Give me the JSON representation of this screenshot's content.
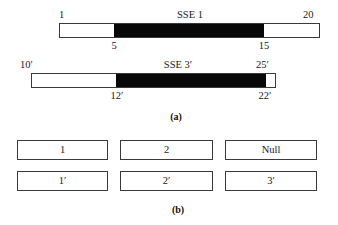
{
  "figure": {
    "part_a": {
      "caption": "(a)",
      "bars": [
        {
          "name": "sse-1",
          "title": "SSE 1",
          "start_label": "1",
          "end_label": "20",
          "region_start_label": "5",
          "region_end_label": "15",
          "segments": [
            {
              "kind": "white",
              "width_px": 54
            },
            {
              "kind": "black",
              "width_px": 150
            },
            {
              "kind": "white",
              "width_px": 56
            }
          ]
        },
        {
          "name": "sse-3-prime",
          "title": "SSE 3′",
          "start_label": "10′",
          "end_label": "25′",
          "region_start_label": "12′",
          "region_end_label": "22′",
          "segments": [
            {
              "kind": "white",
              "width_px": 84
            },
            {
              "kind": "black",
              "width_px": 150
            },
            {
              "kind": "white",
              "width_px": 11
            }
          ]
        }
      ]
    },
    "part_b": {
      "caption": "(b)",
      "rows": [
        {
          "name": "row-unprimed",
          "cells": [
            "1",
            "2",
            "Null"
          ]
        },
        {
          "name": "row-primed",
          "cells": [
            "1′",
            "2′",
            "3′"
          ]
        }
      ]
    }
  },
  "colors": {
    "black_segment": "#080808",
    "white_segment": "#ffffff",
    "outline": "#3a3a3a",
    "text": "#1a1a1a",
    "background": "#ffffff"
  }
}
